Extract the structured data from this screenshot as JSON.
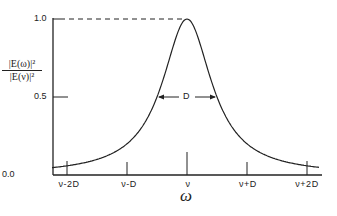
{
  "chart_data": {
    "type": "line",
    "title": "",
    "xlabel": "ω",
    "ylabel": "|E(ω)|² / |E(ν)|²",
    "ylabel_numerator": "|E(ω)|²",
    "ylabel_denominator": "|E(ν)|²",
    "x_ticks": [
      "ν-2D",
      "ν-D",
      "ν",
      "ν+D",
      "ν+2D"
    ],
    "y_ticks": [
      "0.0",
      "0.5",
      "1.0"
    ],
    "ylim": [
      0,
      1.0
    ],
    "xlim_in_D_units": [
      -2.25,
      2.2
    ],
    "series": [
      {
        "name": "Lorentzian lineshape",
        "description": "Peak 1.0 at ν, full width at half maximum D",
        "x_in_D_units": [
          -2.25,
          -2,
          -1.5,
          -1,
          -0.75,
          -0.5,
          -0.25,
          0,
          0.25,
          0.5,
          0.75,
          1,
          1.5,
          2,
          2.2
        ],
        "y": [
          0.047,
          0.059,
          0.1,
          0.2,
          0.31,
          0.5,
          0.8,
          1.0,
          0.8,
          0.5,
          0.31,
          0.2,
          0.1,
          0.059,
          0.049
        ]
      }
    ],
    "annotations": [
      {
        "text": "D",
        "type": "double-arrow",
        "at_y": 0.5,
        "meaning": "full width at half maximum"
      },
      {
        "type": "dashed-line",
        "from": "y-axis at 1.0",
        "to": "peak"
      }
    ],
    "grid": false,
    "legend": null
  }
}
